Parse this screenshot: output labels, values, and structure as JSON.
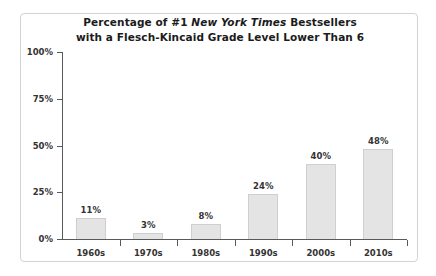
{
  "chart_data": {
    "type": "bar",
    "title": "Percentage of #1 New York Times Bestsellers with a Flesch-Kincaid Grade Level Lower Than 6",
    "title_line_1_prefix": "Percentage of #1 ",
    "title_line_1_italic": "New York Times",
    "title_line_1_suffix": " Bestsellers",
    "title_line_2": "with a Flesch-Kincaid Grade Level Lower Than 6",
    "categories": [
      "1960s",
      "1970s",
      "1980s",
      "1990s",
      "2000s",
      "2010s"
    ],
    "values": [
      11,
      3,
      8,
      24,
      40,
      48
    ],
    "value_labels": [
      "11%",
      "3%",
      "8%",
      "24%",
      "40%",
      "48%"
    ],
    "xlabel": "",
    "ylabel": "",
    "ylim": [
      0,
      100
    ],
    "yticks": [
      0,
      25,
      50,
      75,
      100
    ],
    "ytick_labels": [
      "0%",
      "25%",
      "50%",
      "75%",
      "100%"
    ],
    "grid": false,
    "legend": false,
    "colors": {
      "bar_fill": "#e4e4e4",
      "bar_border": "#cfcfcf",
      "axis": "#595959",
      "text": "#333333",
      "title": "#1b1b1b",
      "frame": "#d3d3d3",
      "background": "#ffffff"
    }
  }
}
